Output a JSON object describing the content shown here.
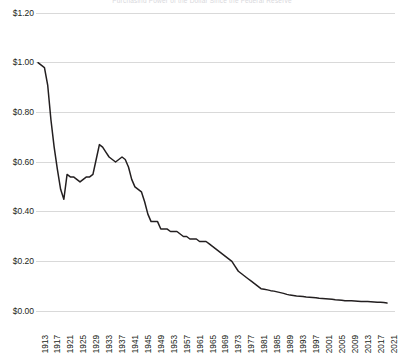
{
  "chart_data": {
    "type": "line",
    "title": "Purchasing Power of the Dollar Since the Federal Reserve",
    "xlabel": "",
    "ylabel": "",
    "ylim": [
      0.0,
      1.2
    ],
    "xlim": [
      1913,
      2021
    ],
    "grid": true,
    "legend": "none",
    "y_ticks": [
      "$0.00",
      "$0.20",
      "$0.40",
      "$0.60",
      "$0.80",
      "$1.00",
      "$1.20"
    ],
    "y_tick_values": [
      0.0,
      0.2,
      0.4,
      0.6,
      0.8,
      1.0,
      1.2
    ],
    "x_ticks": [
      "1913",
      "1917",
      "1921",
      "1925",
      "1929",
      "1933",
      "1937",
      "1941",
      "1945",
      "1949",
      "1953",
      "1957",
      "1961",
      "1965",
      "1969",
      "1973",
      "1977",
      "1981",
      "1985",
      "1989",
      "1993",
      "1997",
      "2001",
      "2005",
      "2009",
      "2013",
      "2017",
      "2021"
    ],
    "series": [
      {
        "name": "Purchasing power of the dollar",
        "color": "#231f20",
        "x": [
          1913,
          1914,
          1915,
          1916,
          1917,
          1918,
          1919,
          1920,
          1921,
          1922,
          1923,
          1924,
          1925,
          1926,
          1927,
          1928,
          1929,
          1930,
          1931,
          1932,
          1933,
          1934,
          1935,
          1936,
          1937,
          1938,
          1939,
          1940,
          1941,
          1942,
          1943,
          1944,
          1945,
          1946,
          1947,
          1948,
          1949,
          1950,
          1951,
          1952,
          1953,
          1954,
          1955,
          1956,
          1957,
          1958,
          1959,
          1960,
          1961,
          1962,
          1963,
          1964,
          1965,
          1966,
          1967,
          1968,
          1969,
          1970,
          1971,
          1972,
          1973,
          1974,
          1975,
          1976,
          1977,
          1978,
          1979,
          1980,
          1981,
          1982,
          1983,
          1984,
          1985,
          1986,
          1987,
          1988,
          1989,
          1990,
          1991,
          1992,
          1993,
          1994,
          1995,
          1996,
          1997,
          1998,
          1999,
          2000,
          2001,
          2002,
          2003,
          2004,
          2005,
          2006,
          2007,
          2008,
          2009,
          2010,
          2011,
          2012,
          2013,
          2014,
          2015,
          2016,
          2017,
          2018,
          2019,
          2020,
          2021
        ],
        "values": [
          1.0,
          0.99,
          0.98,
          0.91,
          0.77,
          0.66,
          0.57,
          0.49,
          0.45,
          0.55,
          0.54,
          0.54,
          0.53,
          0.52,
          0.53,
          0.54,
          0.54,
          0.55,
          0.61,
          0.67,
          0.66,
          0.64,
          0.62,
          0.61,
          0.6,
          0.61,
          0.62,
          0.61,
          0.58,
          0.53,
          0.5,
          0.49,
          0.48,
          0.44,
          0.39,
          0.36,
          0.36,
          0.36,
          0.33,
          0.33,
          0.33,
          0.32,
          0.32,
          0.32,
          0.31,
          0.3,
          0.3,
          0.29,
          0.29,
          0.29,
          0.28,
          0.28,
          0.28,
          0.27,
          0.26,
          0.25,
          0.24,
          0.23,
          0.22,
          0.21,
          0.2,
          0.18,
          0.16,
          0.15,
          0.14,
          0.13,
          0.12,
          0.11,
          0.1,
          0.09,
          0.088,
          0.085,
          0.082,
          0.08,
          0.077,
          0.074,
          0.071,
          0.067,
          0.064,
          0.062,
          0.06,
          0.059,
          0.058,
          0.056,
          0.055,
          0.054,
          0.053,
          0.051,
          0.05,
          0.049,
          0.048,
          0.047,
          0.045,
          0.044,
          0.043,
          0.041,
          0.041,
          0.041,
          0.04,
          0.039,
          0.038,
          0.038,
          0.038,
          0.037,
          0.036,
          0.035,
          0.035,
          0.034,
          0.032
        ]
      }
    ]
  },
  "axes": {
    "gridline_color": "#d9d9d9",
    "line_color": "#231f20",
    "background": "#ffffff"
  }
}
